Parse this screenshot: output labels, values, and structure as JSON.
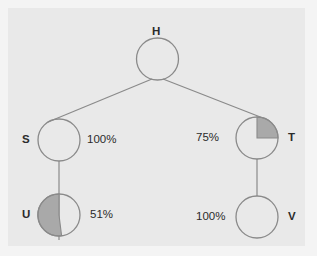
{
  "figure": {
    "kind": "probability-tree-diagram",
    "background_color": "#f4f4f4",
    "panel_color": "#e9e9e9",
    "stroke_color": "#8a8a8a",
    "fill_color": "#a9a9a9",
    "text_color": "#2b2b2b"
  },
  "nodes": [
    {
      "id": "H",
      "label": "H",
      "cx": 157.5,
      "cy": 59,
      "r": 21,
      "fill_fraction": 0,
      "fill_style": "none",
      "label_position": "top"
    },
    {
      "id": "S",
      "label": "S",
      "cx": 59,
      "cy": 140,
      "r": 21,
      "fill_fraction": 0,
      "fill_style": "none",
      "label_position": "left"
    },
    {
      "id": "T",
      "label": "T",
      "cx": 257,
      "cy": 138,
      "r": 21,
      "fill_fraction": 0.25,
      "fill_style": "quadrant-upper-right",
      "label_position": "right"
    },
    {
      "id": "U",
      "label": "U",
      "cx": 59,
      "cy": 215,
      "r": 21,
      "fill_fraction": 0.49,
      "fill_style": "left-half",
      "label_position": "left"
    },
    {
      "id": "V",
      "label": "V",
      "cx": 257,
      "cy": 217,
      "r": 21,
      "fill_fraction": 0,
      "fill_style": "none",
      "label_position": "right"
    }
  ],
  "edges": [
    {
      "id": "edge-h-s",
      "from": "H",
      "to": "S",
      "x1": 152,
      "y1": 79,
      "x2": 48,
      "y2": 122
    },
    {
      "id": "edge-h-t",
      "from": "H",
      "to": "T",
      "x1": 163,
      "y1": 79,
      "x2": 268,
      "y2": 120
    },
    {
      "id": "edge-s-u",
      "from": "S",
      "to": "U",
      "x1": 59,
      "y1": 161,
      "x2": 59,
      "y2": 240
    },
    {
      "id": "edge-t-v",
      "from": "T",
      "to": "V",
      "x1": 257,
      "y1": 159,
      "x2": 257,
      "y2": 196
    }
  ],
  "node_labels": {
    "H": {
      "text": "H",
      "x": 152,
      "y": 26
    },
    "S": {
      "text": "S",
      "x": 22,
      "y": 134
    },
    "T": {
      "text": "T",
      "x": 288,
      "y": 132
    },
    "U": {
      "text": "U",
      "x": 22,
      "y": 209
    },
    "V": {
      "text": "V",
      "x": 288,
      "y": 211
    }
  },
  "percent_labels": [
    {
      "id": "pct-s",
      "node": "S",
      "text": "100%",
      "x": 87,
      "y": 134
    },
    {
      "id": "pct-t",
      "node": "T",
      "text": "75%",
      "x": 196,
      "y": 132
    },
    {
      "id": "pct-u",
      "node": "U",
      "text": "51%",
      "x": 90,
      "y": 209
    },
    {
      "id": "pct-v",
      "node": "V",
      "text": "100%",
      "x": 196,
      "y": 211
    }
  ]
}
